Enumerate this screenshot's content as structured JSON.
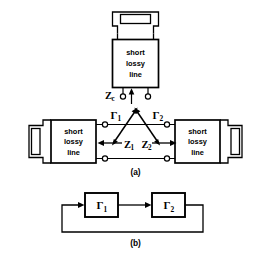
{
  "figure": {
    "caption_a": "(a)",
    "caption_b": "(b)"
  },
  "part_a": {
    "top_block": {
      "line1": "short",
      "line2": "lossy",
      "line3": "line"
    },
    "left_block": {
      "line1": "short",
      "line2": "lossy",
      "line3": "line"
    },
    "right_block": {
      "line1": "short",
      "line2": "lossy",
      "line3": "line"
    },
    "labels": {
      "zc": "Z",
      "zc_sub": "c",
      "gamma1": "Γ",
      "gamma1_sub": "1",
      "gamma2": "Γ",
      "gamma2_sub": "2",
      "z1": "Z",
      "z1_sub": "1",
      "z2": "Z",
      "z2_sub": "2"
    }
  },
  "part_b": {
    "block1": {
      "symbol": "Γ",
      "sub": "1"
    },
    "block2": {
      "symbol": "Γ",
      "sub": "2"
    }
  },
  "style": {
    "stroke": "#000000",
    "fill": "#ffffff"
  }
}
